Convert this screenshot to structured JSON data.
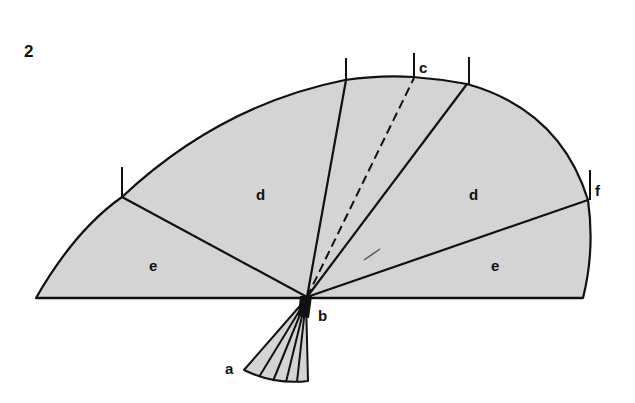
{
  "figure": {
    "number": "2",
    "fill_color": "#d4d4d4",
    "stroke_color": "#111111",
    "labels": {
      "a": "a",
      "b": "b",
      "c": "c",
      "d_left": "d",
      "d_right": "d",
      "e_left": "e",
      "e_right": "e",
      "f": "f"
    }
  }
}
